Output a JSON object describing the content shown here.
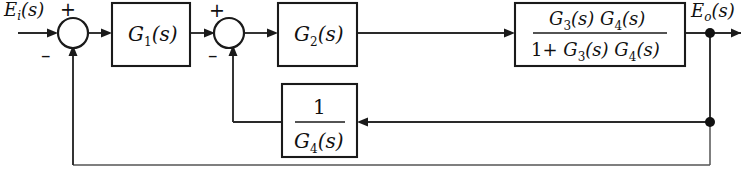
{
  "diagram": {
    "type": "block-diagram",
    "input_label": "E",
    "input_sub": "i",
    "input_tail": "(s)",
    "output_label": "E",
    "output_sub": "o",
    "output_tail": "(s)",
    "sum1": {
      "plus": "+",
      "minus": "–"
    },
    "sum2": {
      "plus": "+",
      "minus": "–"
    },
    "blocks": {
      "g1": {
        "base": "G",
        "sub": "1",
        "tail": "(s)"
      },
      "g2": {
        "base": "G",
        "sub": "2",
        "tail": "(s)"
      },
      "big": {
        "numerator_part1_base": "G",
        "numerator_part1_sub": "3",
        "numerator_part1_tail": "(s)",
        "numerator_part2_base": "G",
        "numerator_part2_sub": "4",
        "numerator_part2_tail": "(s)",
        "denominator_prefix": "1+",
        "denominator_part1_base": "G",
        "denominator_part1_sub": "3",
        "denominator_part1_tail": "(s)",
        "denominator_part2_base": "G",
        "denominator_part2_sub": "4",
        "denominator_part2_tail": "(s)"
      },
      "feedback": {
        "numerator": "1",
        "denominator_base": "G",
        "denominator_sub": "4",
        "denominator_tail": "(s)"
      }
    },
    "colors": {
      "line": "#2a2a2a",
      "stroke": "#1a1a1a",
      "text": "#111111",
      "background": "#ffffff"
    }
  }
}
